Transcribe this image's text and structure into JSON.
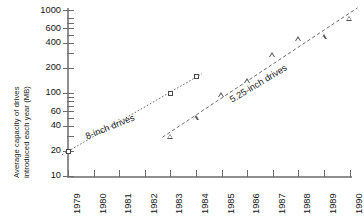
{
  "chart_data": {
    "type": "scatter",
    "title": "",
    "xlabel": "",
    "ylabel_line1": "Average capacity of drives",
    "ylabel_line2": "introduced each year (MB)",
    "ylabel": "Average capacity of drives introduced each year (MB)",
    "yscale": "log",
    "ylim": [
      10,
      1000
    ],
    "xlim": [
      1979,
      1990
    ],
    "grid": false,
    "legend_position": "inline-annotation",
    "categories": [
      "1979",
      "1980",
      "1981",
      "1982",
      "1983",
      "1984",
      "1985",
      "1986",
      "1987",
      "1988",
      "1989",
      "1990"
    ],
    "ytick_labels": [
      "1000",
      "600",
      "400",
      "200",
      "100",
      "60",
      "40",
      "20",
      "10"
    ],
    "ytick_values": [
      1000,
      600,
      400,
      200,
      100,
      60,
      40,
      20,
      10
    ],
    "yminor_values": [
      800,
      700,
      500,
      300,
      90,
      80,
      70,
      50,
      30
    ],
    "series": [
      {
        "name": "8-inch drives",
        "marker": "square",
        "trend": "dotted",
        "points": [
          {
            "x": 1979,
            "y": 20
          },
          {
            "x": 1983,
            "y": 100
          },
          {
            "x": 1984,
            "y": 160
          }
        ]
      },
      {
        "name": "5.25-inch drives",
        "marker": "triangle",
        "trend": "dashed",
        "points": [
          {
            "x": 1983,
            "y": 30
          },
          {
            "x": 1984,
            "y": 50
          },
          {
            "x": 1985,
            "y": 95
          },
          {
            "x": 1986,
            "y": 140
          },
          {
            "x": 1987,
            "y": 290
          },
          {
            "x": 1988,
            "y": 450
          },
          {
            "x": 1989,
            "y": 480
          },
          {
            "x": 1990,
            "y": 800
          }
        ]
      }
    ],
    "annotations": [
      {
        "text": "8-inch drives",
        "series": "8-inch drives"
      },
      {
        "text": "5.25-inch drives",
        "series": "5.25-inch drives"
      }
    ],
    "colors": {
      "axis": "#8f8f8f",
      "tick": "#6b6b6b",
      "text": "#141414",
      "marker": "#4a4a4a",
      "trendline": "#5a5a5a"
    }
  }
}
